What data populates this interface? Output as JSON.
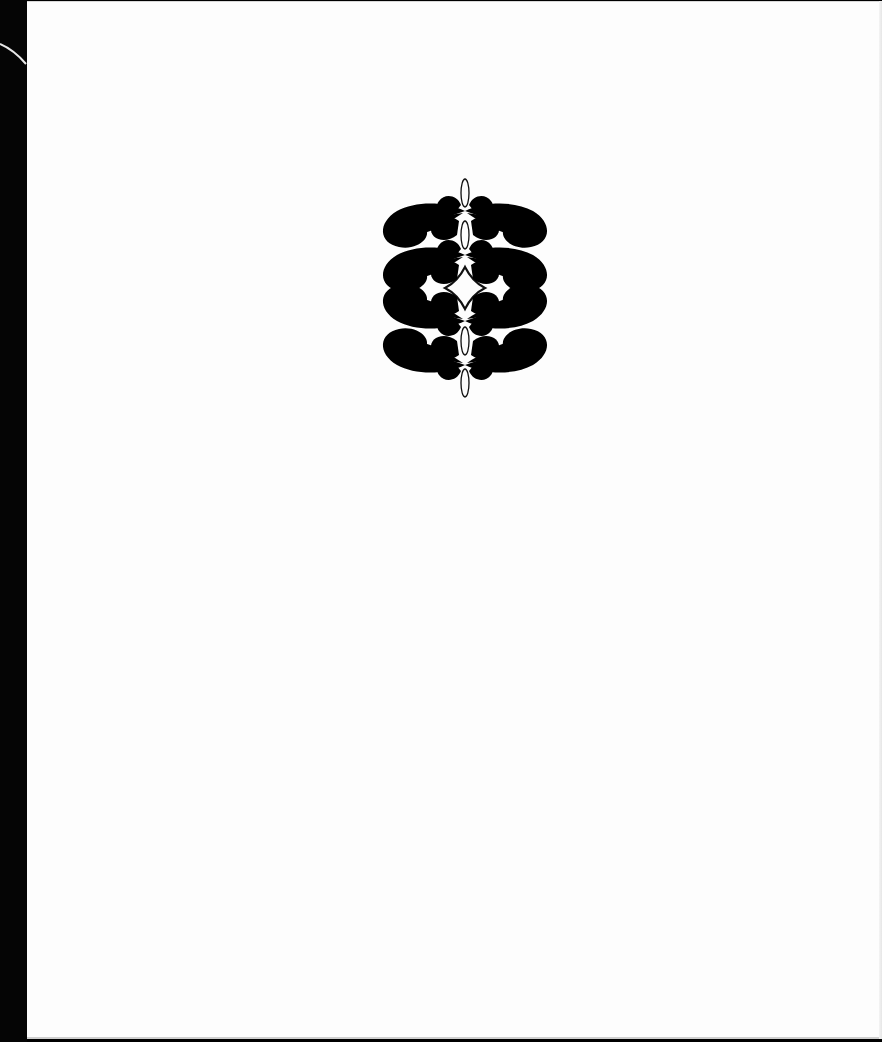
{
  "document": {
    "type": "scanned-book-page",
    "content": "decorative-ornament",
    "text": []
  },
  "ornament": {
    "style": "calligraphic flourish",
    "rows": 4,
    "symmetry": "bilateral",
    "color": "#111111"
  },
  "colors": {
    "page": "#fdfdfd",
    "binding": "#050505",
    "ink": "#111111"
  }
}
